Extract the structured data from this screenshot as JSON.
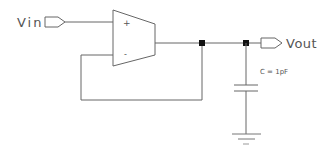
{
  "diagram": {
    "type": "circuit-schematic",
    "ports": {
      "input_label": "Vin",
      "output_label": "Vout"
    },
    "opamp": {
      "plus_label": "+",
      "minus_label": "-"
    },
    "capacitor": {
      "label": "C = 1pF"
    },
    "colors": {
      "wire": "#555555",
      "junction": "#111111",
      "background": "#ffffff"
    }
  }
}
